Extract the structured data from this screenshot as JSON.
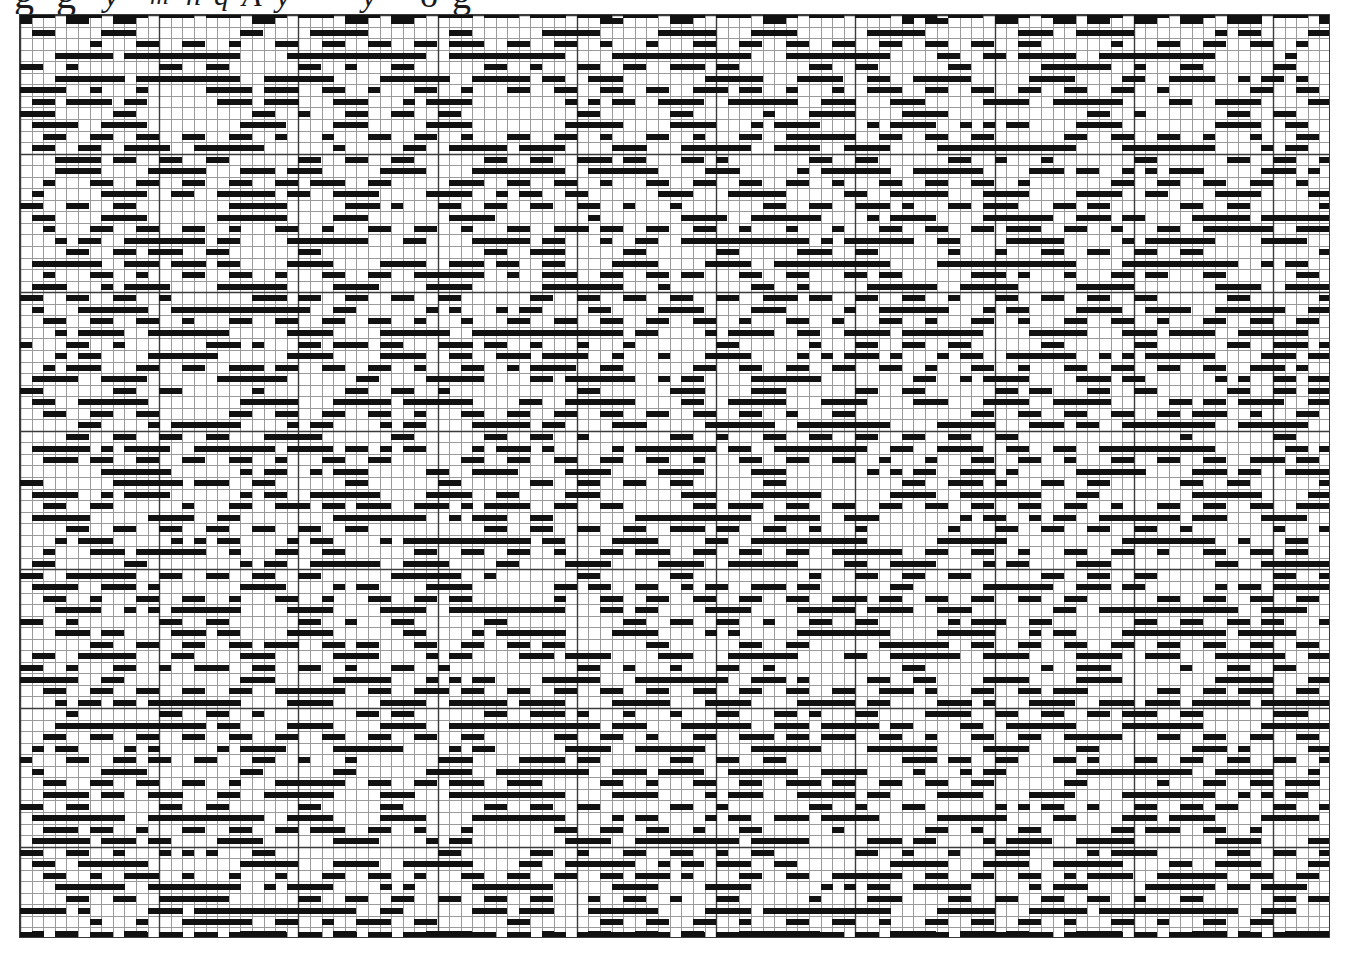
{
  "document": {
    "kind": "weaving-draft-graph-paper",
    "title": "",
    "background_color": "#ffffff",
    "ink_color": "#1a1a1a",
    "grid_line_color": "#9a9a9a",
    "heavy_line_color": "#3a3a3a",
    "border_color": "#3a3a3a"
  },
  "handwriting": {
    "visible": true,
    "note": "row of handwritten ink cut off by the top edge of the page; only the bottoms of the glyphs are visible",
    "fragments": [
      {
        "text": "g",
        "x": 14,
        "size": 40,
        "italic": false
      },
      {
        "text": "g",
        "x": 56,
        "size": 40,
        "italic": false
      },
      {
        "text": "y",
        "x": 104,
        "size": 34,
        "italic": true
      },
      {
        "text": "m",
        "x": 150,
        "size": 26,
        "italic": true
      },
      {
        "text": "h",
        "x": 186,
        "size": 30,
        "italic": true
      },
      {
        "text": "q",
        "x": 214,
        "size": 30,
        "italic": true
      },
      {
        "text": "A",
        "x": 242,
        "size": 32,
        "italic": true
      },
      {
        "text": "y",
        "x": 276,
        "size": 32,
        "italic": true
      },
      {
        "text": "—",
        "x": 310,
        "size": 34,
        "italic": false
      },
      {
        "text": "y",
        "x": 362,
        "size": 32,
        "italic": true
      },
      {
        "text": "o",
        "x": 420,
        "size": 36,
        "italic": false
      },
      {
        "text": "g",
        "x": 452,
        "size": 38,
        "italic": false
      }
    ]
  },
  "grid": {
    "origin_x": 19,
    "origin_y": 14,
    "width_px": 1311,
    "height_px": 924,
    "columns": 113,
    "rows": 80,
    "cell_width": 11.6,
    "cell_height": 11.55,
    "heavy_column_interval": 12,
    "heavy_row_interval": 12,
    "mark_span_columns": 2,
    "mark_height_ratio": 0.5,
    "mark_color": "#111111"
  },
  "pattern": {
    "type": "overshot-twill-draft",
    "description": "Point-twill / overshot weaving draft. Filled marks are two squares wide and half a square tall, stepping one square per row to form long diagonals that reverse at regular points, producing large diamond and zigzag motifs across the sheet.",
    "shafts": 8,
    "treadling_repeat": 40,
    "threading_repeat": 28,
    "diagonal_direction_cycle": [
      "down-right",
      "down-left"
    ],
    "seed": 20250411,
    "motif_period_x": 28,
    "motif_period_y": 40
  },
  "chart_data": {
    "type": "heatmap",
    "title": "",
    "xlabel": "",
    "ylabel": "",
    "grid": true,
    "legend": "none",
    "categories_x": 113,
    "categories_y": 80,
    "values_note": "binary occupancy grid generated from a point-twill weaving draft; 1 = inked mark, 0 = empty square"
  }
}
